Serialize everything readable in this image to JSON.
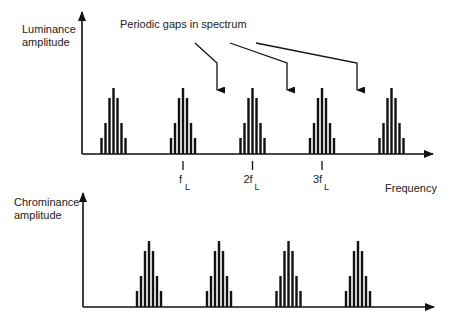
{
  "top_plot": {
    "y_label_line1": "Luminance",
    "y_label_line2": "amplitude",
    "annotation": "Periodic gaps in spectrum",
    "cluster_centers": [
      113.5,
      183,
      252.5,
      322,
      391.5
    ],
    "tick_labels": [
      {
        "main": "f",
        "sub": "L",
        "x": 183
      },
      {
        "main": "2f",
        "sub": "L",
        "x": 252.5
      },
      {
        "main": "3f",
        "sub": "L",
        "x": 322
      }
    ],
    "x_label": "Frequency",
    "gap_arrow_targets": [
      217,
      287,
      357
    ]
  },
  "bottom_plot": {
    "y_label_line1": "Chrominance",
    "y_label_line2": "amplitude",
    "cluster_centers": [
      149,
      219,
      288.5,
      358
    ]
  },
  "bar_profile": [
    {
      "dx": -12,
      "h": 16
    },
    {
      "dx": -8,
      "h": 31
    },
    {
      "dx": -4,
      "h": 56
    },
    {
      "dx": 0,
      "h": 66
    },
    {
      "dx": 4,
      "h": 56
    },
    {
      "dx": 8,
      "h": 31
    },
    {
      "dx": 12,
      "h": 16
    }
  ],
  "colors": {
    "ink": "#111111",
    "text": "#222222"
  }
}
